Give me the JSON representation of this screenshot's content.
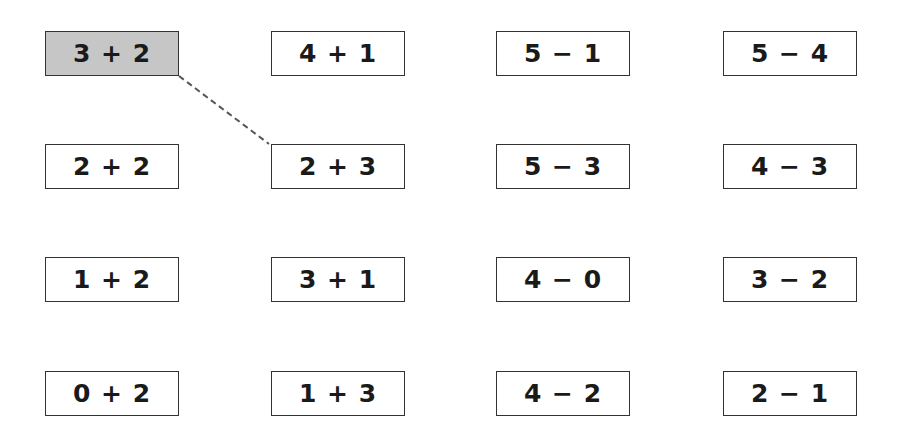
{
  "colors": {
    "selected_fill": "#c6c6c6",
    "border": "#333333",
    "connector": "#555555"
  },
  "grid": {
    "rows": [
      [
        "3 + 2",
        "4 + 1",
        "5 − 1",
        "5 − 4"
      ],
      [
        "2 + 2",
        "2 + 3",
        "5 − 3",
        "4 − 3"
      ],
      [
        "1 + 2",
        "3 + 1",
        "4 − 0",
        "3 − 2"
      ],
      [
        "0 + 2",
        "1 + 3",
        "4 − 2",
        "2 − 1"
      ]
    ]
  },
  "selected": {
    "row": 0,
    "col": 0,
    "label": "3 + 2"
  },
  "connection": {
    "from": "3 + 2",
    "to": "2 + 3",
    "style": "dashed"
  }
}
